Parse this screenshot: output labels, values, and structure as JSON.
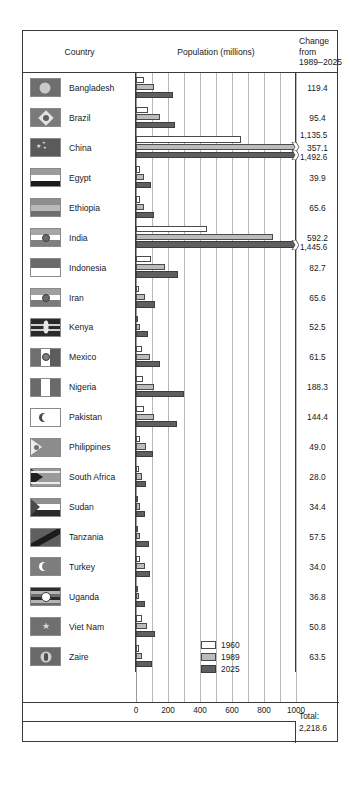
{
  "header": {
    "country_label": "Country",
    "population_label": "Population (millions)",
    "change_line1": "Change",
    "change_line2": "from",
    "change_line3": "1989–2025"
  },
  "axis": {
    "ticks": [
      "0",
      "200",
      "400",
      "600",
      "800",
      "1000"
    ],
    "min": 0,
    "max": 1000
  },
  "legend": {
    "items": [
      {
        "label": "1960",
        "color": "#ffffff"
      },
      {
        "label": "1989",
        "color": "#bcbcbc"
      },
      {
        "label": "2025",
        "color": "#5f5f5f"
      }
    ]
  },
  "footer": {
    "total_label": "Total:",
    "total_value": "2,218.6"
  },
  "chart_data": {
    "type": "bar",
    "title": "Population (millions)",
    "xlabel": "Population (millions)",
    "ylabel": "Country",
    "xlim": [
      0,
      1000
    ],
    "grid": true,
    "legend_position": "inside-bottom-right",
    "series_names": [
      "1960",
      "1989",
      "2025"
    ],
    "categories": [
      "Bangladesh",
      "Brazil",
      "China",
      "Egypt",
      "Ethiopia",
      "India",
      "Indonesia",
      "Iran",
      "Kenya",
      "Mexico",
      "Nigeria",
      "Pakistan",
      "Philippines",
      "South Africa",
      "Sudan",
      "Tanzania",
      "Turkey",
      "Uganda",
      "Viet Nam",
      "Zaire"
    ],
    "series": [
      {
        "name": "1960",
        "values": [
          51.4,
          72.6,
          657.5,
          27.8,
          24.2,
          442.3,
          96.2,
          21.6,
          8.1,
          38.0,
          42.3,
          49.9,
          27.9,
          17.4,
          11.2,
          10.0,
          27.5,
          7.0,
          34.7,
          15.9
        ]
      },
      {
        "name": "1989",
        "values": [
          110.0,
          147.3,
          1135.5,
          51.7,
          48.9,
          853.4,
          179.1,
          54.3,
          24.0,
          86.7,
          113.7,
          110.4,
          60.1,
          35.0,
          24.5,
          25.6,
          54.9,
          17.8,
          66.7,
          34.5
        ]
      },
      {
        "name": "2025",
        "values": [
          229.4,
          242.7,
          1492.6,
          91.6,
          114.5,
          1445.6,
          261.8,
          119.9,
          76.5,
          148.2,
          302.0,
          254.8,
          109.1,
          63.0,
          58.9,
          83.1,
          88.9,
          54.6,
          117.5,
          98.0
        ]
      }
    ],
    "rows": [
      {
        "country": "Bangladesh",
        "v1960": 51.4,
        "v1989": 110.0,
        "v2025": 229.4,
        "change": "119.4",
        "clipped": false
      },
      {
        "country": "Brazil",
        "v1960": 72.6,
        "v1989": 147.3,
        "v2025": 242.7,
        "change": "95.4",
        "clipped": false
      },
      {
        "country": "China",
        "v1960": 657.5,
        "v1989": 1135.5,
        "v2025": 1492.6,
        "change": "357.1",
        "clipped": true,
        "label_1989": "1,135.5",
        "label_2025": "1,492.6"
      },
      {
        "country": "Egypt",
        "v1960": 27.8,
        "v1989": 51.7,
        "v2025": 91.6,
        "change": "39.9",
        "clipped": false
      },
      {
        "country": "Ethiopia",
        "v1960": 24.2,
        "v1989": 48.9,
        "v2025": 114.5,
        "change": "65.6",
        "clipped": false
      },
      {
        "country": "India",
        "v1960": 442.3,
        "v1989": 853.4,
        "v2025": 1445.6,
        "change": "592.2",
        "clipped": true,
        "label_2025": "1,445.6"
      },
      {
        "country": "Indonesia",
        "v1960": 96.2,
        "v1989": 179.1,
        "v2025": 261.8,
        "change": "82.7",
        "clipped": false
      },
      {
        "country": "Iran",
        "v1960": 21.6,
        "v1989": 54.3,
        "v2025": 119.9,
        "change": "65.6",
        "clipped": false
      },
      {
        "country": "Kenya",
        "v1960": 8.1,
        "v1989": 24.0,
        "v2025": 76.5,
        "change": "52.5",
        "clipped": false
      },
      {
        "country": "Mexico",
        "v1960": 38.0,
        "v1989": 86.7,
        "v2025": 148.2,
        "change": "61.5",
        "clipped": false
      },
      {
        "country": "Nigeria",
        "v1960": 42.3,
        "v1989": 113.7,
        "v2025": 302.0,
        "change": "188.3",
        "clipped": false
      },
      {
        "country": "Pakistan",
        "v1960": 49.9,
        "v1989": 110.4,
        "v2025": 254.8,
        "change": "144.4",
        "clipped": false
      },
      {
        "country": "Philippines",
        "v1960": 27.9,
        "v1989": 60.1,
        "v2025": 109.1,
        "change": "49.0",
        "clipped": false
      },
      {
        "country": "South Africa",
        "v1960": 17.4,
        "v1989": 35.0,
        "v2025": 63.0,
        "change": "28.0",
        "clipped": false
      },
      {
        "country": "Sudan",
        "v1960": 11.2,
        "v1989": 24.5,
        "v2025": 58.9,
        "change": "34.4",
        "clipped": false
      },
      {
        "country": "Tanzania",
        "v1960": 10.0,
        "v1989": 25.6,
        "v2025": 83.1,
        "change": "57.5",
        "clipped": false
      },
      {
        "country": "Turkey",
        "v1960": 27.5,
        "v1989": 54.9,
        "v2025": 88.9,
        "change": "34.0",
        "clipped": false
      },
      {
        "country": "Uganda",
        "v1960": 7.0,
        "v1989": 17.8,
        "v2025": 54.6,
        "change": "36.8",
        "clipped": false
      },
      {
        "country": "Viet Nam",
        "v1960": 34.7,
        "v1989": 66.7,
        "v2025": 117.5,
        "change": "50.8",
        "clipped": false
      },
      {
        "country": "Zaire",
        "v1960": 15.9,
        "v1989": 34.5,
        "v2025": 98.0,
        "change": "63.5",
        "clipped": false
      }
    ]
  },
  "flags": {
    "Bangladesh": {
      "name": "flag-bangladesh",
      "type": "circle",
      "bg": "#6e6e6e",
      "fg": "#c9c9c9"
    },
    "Brazil": {
      "name": "flag-brazil",
      "type": "diamond",
      "bg": "#7a7a7a",
      "fg": "#e2e2e2"
    },
    "China": {
      "name": "flag-china",
      "type": "stars",
      "bg": "#5a5a5a",
      "fg": "#dcdcdc"
    },
    "Egypt": {
      "name": "flag-egypt",
      "type": "tricolor-h",
      "bands": [
        "#9c9c9c",
        "#ffffff",
        "#1b1b1b"
      ]
    },
    "Ethiopia": {
      "name": "flag-ethiopia",
      "type": "tricolor-h",
      "bands": [
        "#8e8e8e",
        "#b9b9b9",
        "#6f6f6f"
      ]
    },
    "India": {
      "name": "flag-india",
      "type": "tricolor-h-wheel",
      "bands": [
        "#a6a6a6",
        "#ffffff",
        "#7f7f7f"
      ]
    },
    "Indonesia": {
      "name": "flag-indonesia",
      "type": "bicolor-h",
      "bands": [
        "#6b6b6b",
        "#ffffff"
      ]
    },
    "Iran": {
      "name": "flag-iran",
      "type": "tricolor-h-emblem",
      "bands": [
        "#a0a0a0",
        "#ffffff",
        "#7a7a7a"
      ]
    },
    "Kenya": {
      "name": "flag-kenya",
      "type": "shield",
      "bg": "#2a2a2a",
      "fg": "#e6e6e6"
    },
    "Mexico": {
      "name": "flag-mexico",
      "type": "tricolor-v-emblem",
      "bands": [
        "#6f6f6f",
        "#ffffff",
        "#5c5c5c"
      ]
    },
    "Nigeria": {
      "name": "flag-nigeria",
      "type": "tricolor-v",
      "bands": [
        "#6a6a6a",
        "#ffffff",
        "#6a6a6a"
      ]
    },
    "Pakistan": {
      "name": "flag-pakistan",
      "type": "crescent",
      "bg": "#ffffff",
      "fg": "#4a4a4a"
    },
    "Philippines": {
      "name": "flag-philippines",
      "type": "triangle-sun",
      "bg": "#8c8c8c",
      "fg": "#ededed"
    },
    "South Africa": {
      "name": "flag-south-africa",
      "type": "ypall",
      "bg": "#9a9a9a",
      "fg": "#1e1e1e"
    },
    "Sudan": {
      "name": "flag-sudan",
      "type": "tricolor-tri",
      "bands": [
        "#8f8f8f",
        "#ffffff",
        "#2b2b2b"
      ]
    },
    "Tanzania": {
      "name": "flag-tanzania",
      "type": "diagonal",
      "bg": "#5f5f5f",
      "fg": "#1c1c1c"
    },
    "Turkey": {
      "name": "flag-turkey",
      "type": "crescent",
      "bg": "#7d7d7d",
      "fg": "#ffffff"
    },
    "Uganda": {
      "name": "flag-uganda",
      "type": "stripes-disc",
      "bands": [
        "#2d2d2d",
        "#b5b5b5",
        "#6d6d6d"
      ]
    },
    "Viet Nam": {
      "name": "flag-viet-nam",
      "type": "star",
      "bg": "#6f6f6f",
      "fg": "#d8d8d8"
    },
    "Zaire": {
      "name": "flag-zaire",
      "type": "disc-torch",
      "bg": "#6a6a6a",
      "fg": "#cfcfcf"
    }
  }
}
